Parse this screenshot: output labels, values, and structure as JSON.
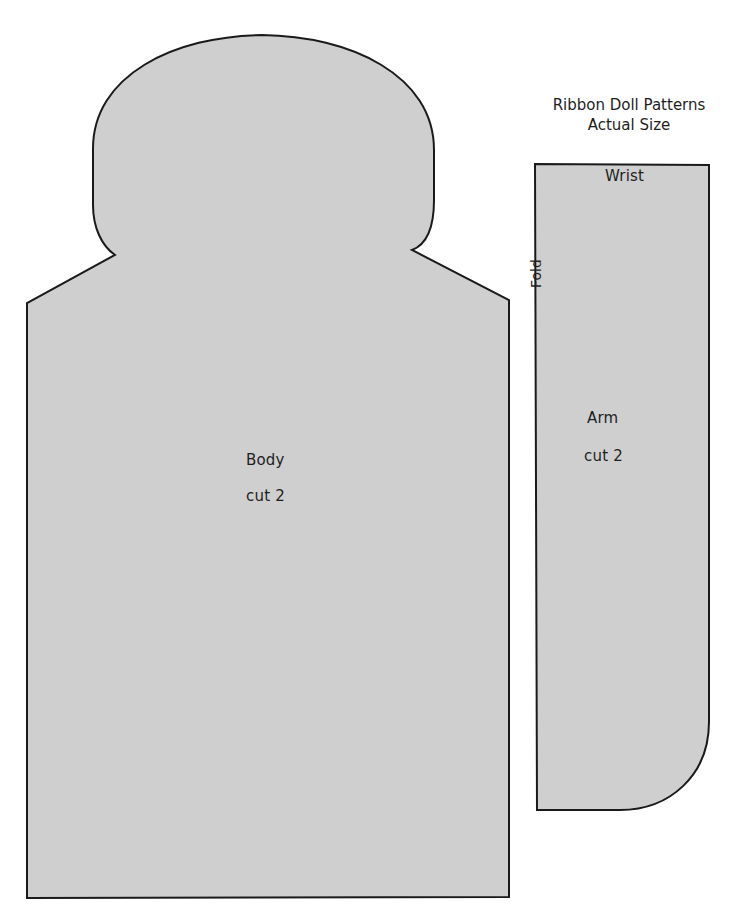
{
  "page": {
    "title_line1": "Ribbon Doll Patterns",
    "title_line2": "Actual Size"
  },
  "colors": {
    "pattern_fill": "#cfcfcf",
    "outline": "#1a1a1a",
    "background": "#ffffff"
  },
  "body_piece": {
    "name": "Body",
    "instruction": "cut 2"
  },
  "arm_piece": {
    "name": "Arm",
    "instruction": "cut 2",
    "top_edge_label": "Wrist",
    "side_edge_label": "Fold"
  }
}
